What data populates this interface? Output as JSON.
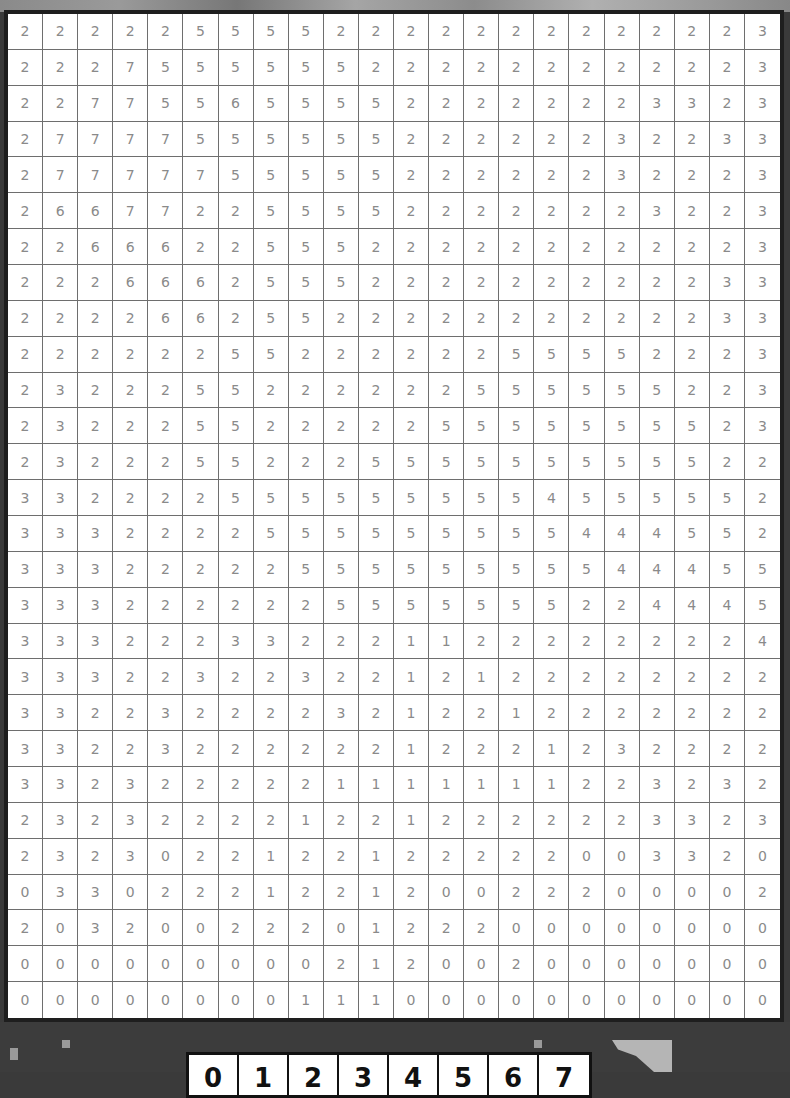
{
  "puzzle": {
    "rows": 28,
    "cols": 22,
    "grid": [
      [
        2,
        2,
        2,
        2,
        2,
        5,
        5,
        5,
        5,
        2,
        2,
        2,
        2,
        2,
        2,
        2,
        2,
        2,
        2,
        2,
        2,
        3
      ],
      [
        2,
        2,
        2,
        7,
        5,
        5,
        5,
        5,
        5,
        5,
        2,
        2,
        2,
        2,
        2,
        2,
        2,
        2,
        2,
        2,
        2,
        3
      ],
      [
        2,
        2,
        7,
        7,
        5,
        5,
        6,
        5,
        5,
        5,
        5,
        2,
        2,
        2,
        2,
        2,
        2,
        2,
        3,
        3,
        2,
        3
      ],
      [
        2,
        7,
        7,
        7,
        7,
        5,
        5,
        5,
        5,
        5,
        5,
        2,
        2,
        2,
        2,
        2,
        2,
        3,
        2,
        2,
        3,
        3
      ],
      [
        2,
        7,
        7,
        7,
        7,
        7,
        5,
        5,
        5,
        5,
        5,
        2,
        2,
        2,
        2,
        2,
        2,
        3,
        2,
        2,
        2,
        3
      ],
      [
        2,
        6,
        6,
        7,
        7,
        2,
        2,
        5,
        5,
        5,
        5,
        2,
        2,
        2,
        2,
        2,
        2,
        2,
        3,
        2,
        2,
        3
      ],
      [
        2,
        2,
        6,
        6,
        6,
        2,
        2,
        5,
        5,
        5,
        2,
        2,
        2,
        2,
        2,
        2,
        2,
        2,
        2,
        2,
        2,
        3
      ],
      [
        2,
        2,
        2,
        6,
        6,
        6,
        2,
        5,
        5,
        5,
        2,
        2,
        2,
        2,
        2,
        2,
        2,
        2,
        2,
        2,
        3,
        3
      ],
      [
        2,
        2,
        2,
        2,
        6,
        6,
        2,
        5,
        5,
        2,
        2,
        2,
        2,
        2,
        2,
        2,
        2,
        2,
        2,
        2,
        3,
        3
      ],
      [
        2,
        2,
        2,
        2,
        2,
        2,
        5,
        5,
        2,
        2,
        2,
        2,
        2,
        2,
        5,
        5,
        5,
        5,
        2,
        2,
        2,
        3
      ],
      [
        2,
        3,
        2,
        2,
        2,
        5,
        5,
        2,
        2,
        2,
        2,
        2,
        2,
        5,
        5,
        5,
        5,
        5,
        5,
        2,
        2,
        3
      ],
      [
        2,
        3,
        2,
        2,
        2,
        5,
        5,
        2,
        2,
        2,
        2,
        2,
        5,
        5,
        5,
        5,
        5,
        5,
        5,
        5,
        2,
        3
      ],
      [
        2,
        3,
        2,
        2,
        2,
        5,
        5,
        2,
        2,
        2,
        5,
        5,
        5,
        5,
        5,
        5,
        5,
        5,
        5,
        5,
        2,
        2
      ],
      [
        3,
        3,
        2,
        2,
        2,
        2,
        5,
        5,
        5,
        5,
        5,
        5,
        5,
        5,
        5,
        4,
        5,
        5,
        5,
        5,
        5,
        2
      ],
      [
        3,
        3,
        3,
        2,
        2,
        2,
        2,
        5,
        5,
        5,
        5,
        5,
        5,
        5,
        5,
        5,
        4,
        4,
        4,
        5,
        5,
        2
      ],
      [
        3,
        3,
        3,
        2,
        2,
        2,
        2,
        2,
        5,
        5,
        5,
        5,
        5,
        5,
        5,
        5,
        5,
        4,
        4,
        4,
        5,
        5
      ],
      [
        3,
        3,
        3,
        2,
        2,
        2,
        2,
        2,
        2,
        5,
        5,
        5,
        5,
        5,
        5,
        5,
        2,
        2,
        4,
        4,
        4,
        5
      ],
      [
        3,
        3,
        3,
        2,
        2,
        2,
        3,
        3,
        2,
        2,
        2,
        1,
        1,
        2,
        2,
        2,
        2,
        2,
        2,
        2,
        2,
        4
      ],
      [
        3,
        3,
        3,
        2,
        2,
        3,
        2,
        2,
        3,
        2,
        2,
        1,
        2,
        1,
        2,
        2,
        2,
        2,
        2,
        2,
        2,
        2
      ],
      [
        3,
        3,
        2,
        2,
        3,
        2,
        2,
        2,
        2,
        3,
        2,
        1,
        2,
        2,
        1,
        2,
        2,
        2,
        2,
        2,
        2,
        2
      ],
      [
        3,
        3,
        2,
        2,
        3,
        2,
        2,
        2,
        2,
        2,
        2,
        1,
        2,
        2,
        2,
        1,
        2,
        3,
        2,
        2,
        2,
        2
      ],
      [
        3,
        3,
        2,
        3,
        2,
        2,
        2,
        2,
        2,
        1,
        1,
        1,
        1,
        1,
        1,
        1,
        2,
        2,
        3,
        2,
        3,
        2
      ],
      [
        2,
        3,
        2,
        3,
        2,
        2,
        2,
        2,
        1,
        2,
        2,
        1,
        2,
        2,
        2,
        2,
        2,
        2,
        3,
        3,
        2,
        3
      ],
      [
        2,
        3,
        2,
        3,
        0,
        2,
        2,
        1,
        2,
        2,
        1,
        2,
        2,
        2,
        2,
        2,
        0,
        0,
        3,
        3,
        2,
        0
      ],
      [
        0,
        3,
        3,
        0,
        2,
        2,
        2,
        1,
        2,
        2,
        1,
        2,
        0,
        0,
        2,
        2,
        2,
        0,
        0,
        0,
        0,
        2
      ],
      [
        2,
        0,
        3,
        2,
        0,
        0,
        2,
        2,
        2,
        0,
        1,
        2,
        2,
        2,
        0,
        0,
        0,
        0,
        0,
        0,
        0,
        0
      ],
      [
        0,
        0,
        0,
        0,
        0,
        0,
        0,
        0,
        0,
        2,
        1,
        2,
        0,
        0,
        2,
        0,
        0,
        0,
        0,
        0,
        0,
        0
      ],
      [
        0,
        0,
        0,
        0,
        0,
        0,
        0,
        0,
        1,
        1,
        1,
        0,
        0,
        0,
        0,
        0,
        0,
        0,
        0,
        0,
        0,
        0
      ]
    ]
  },
  "palette": {
    "labels": [
      "0",
      "1",
      "2",
      "3",
      "4",
      "5",
      "6",
      "7"
    ]
  },
  "colors": {
    "cell_text": "#8a8a8a",
    "grid_line": "#6e6e6e",
    "board_border": "#1e1e1e",
    "background": "#3a3a3a"
  }
}
